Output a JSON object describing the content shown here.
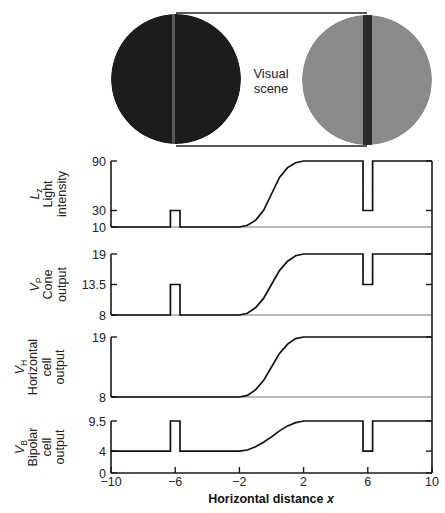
{
  "scene": {
    "label_line1": "Visual",
    "label_line2": "scene",
    "left_disk": {
      "cx": 176,
      "cy": 79,
      "r": 65,
      "fill": "#1c1c1c",
      "stripe_x": 172,
      "stripe_w": 3,
      "stripe_fill": "#5a5a5a"
    },
    "right_disk": {
      "cx": 367,
      "cy": 80,
      "r": 65,
      "fill": "#8a8a8a",
      "stripe_x": 363,
      "stripe_w": 9,
      "stripe_fill": "#2a2a2a"
    },
    "connector_top_y": 13,
    "connector_bottom_y": 146
  },
  "chart_data": {
    "type": "line",
    "title": "",
    "xlabel": "Horizontal distance x",
    "xlim": [
      -10,
      10
    ],
    "x_ticks": [
      -10,
      -6,
      -2,
      2,
      6,
      10
    ],
    "x_tick_labels": [
      "−10",
      "−6",
      "−2",
      "2",
      "6",
      "10"
    ],
    "grid": false,
    "panels": [
      {
        "id": "light",
        "symbol": "L",
        "subscript": "z",
        "label_lines": [
          "Light",
          "intensity"
        ],
        "y_ticks": [
          10,
          30,
          90
        ],
        "y_tick_labels": [
          "10",
          "30",
          "90"
        ],
        "ylim": [
          10,
          90
        ],
        "pixel": {
          "ymin_px": 227,
          "ymax_px": 161
        },
        "points": [
          [
            -10,
            10
          ],
          [
            -6.3,
            10
          ],
          [
            -6.3,
            30
          ],
          [
            -5.7,
            30
          ],
          [
            -5.7,
            10
          ],
          [
            -2,
            10
          ],
          [
            -1.5,
            12
          ],
          [
            -1,
            18
          ],
          [
            -0.5,
            30
          ],
          [
            0,
            50
          ],
          [
            0.5,
            70
          ],
          [
            1,
            82
          ],
          [
            1.5,
            88
          ],
          [
            2,
            90
          ],
          [
            5.7,
            90
          ],
          [
            5.7,
            30
          ],
          [
            6.3,
            30
          ],
          [
            6.3,
            90
          ],
          [
            10,
            90
          ]
        ]
      },
      {
        "id": "cone",
        "symbol": "V",
        "subscript": "P",
        "label_lines": [
          "Cone",
          "output"
        ],
        "y_ticks": [
          8,
          13.5,
          19
        ],
        "y_tick_labels": [
          "8",
          "13.5",
          "19"
        ],
        "ylim": [
          8,
          19
        ],
        "pixel": {
          "ymin_px": 315,
          "ymax_px": 254
        },
        "points": [
          [
            -10,
            8
          ],
          [
            -6.3,
            8
          ],
          [
            -6.3,
            13.5
          ],
          [
            -5.7,
            13.5
          ],
          [
            -5.7,
            8
          ],
          [
            -2,
            8
          ],
          [
            -1.5,
            8.3
          ],
          [
            -1,
            9.3
          ],
          [
            -0.5,
            11
          ],
          [
            0,
            13.5
          ],
          [
            0.5,
            16
          ],
          [
            1,
            17.7
          ],
          [
            1.5,
            18.7
          ],
          [
            2,
            19
          ],
          [
            5.7,
            19
          ],
          [
            5.7,
            13.5
          ],
          [
            6.3,
            13.5
          ],
          [
            6.3,
            19
          ],
          [
            10,
            19
          ]
        ]
      },
      {
        "id": "horizontal",
        "symbol": "V",
        "subscript": "H",
        "label_lines": [
          "Horizontal",
          "cell",
          "output"
        ],
        "y_ticks": [
          8,
          19
        ],
        "y_tick_labels": [
          "8",
          "19"
        ],
        "ylim": [
          8,
          19
        ],
        "pixel": {
          "ymin_px": 397,
          "ymax_px": 337
        },
        "points": [
          [
            -10,
            8
          ],
          [
            -2,
            8
          ],
          [
            -1.5,
            8.3
          ],
          [
            -1,
            9.3
          ],
          [
            -0.5,
            11
          ],
          [
            0,
            13.5
          ],
          [
            0.5,
            16
          ],
          [
            1,
            17.7
          ],
          [
            1.5,
            18.7
          ],
          [
            2,
            19
          ],
          [
            10,
            19
          ]
        ]
      },
      {
        "id": "bipolar",
        "symbol": "V",
        "subscript": "B",
        "label_lines": [
          "Bipolar",
          "cell",
          "output"
        ],
        "y_ticks": [
          0,
          4,
          9.5
        ],
        "y_tick_labels": [
          "0",
          "4",
          "9.5"
        ],
        "ylim": [
          0,
          9.5
        ],
        "pixel": {
          "ymin_px": 473,
          "ymax_px": 421
        },
        "points": [
          [
            -10,
            4
          ],
          [
            -6.3,
            4
          ],
          [
            -6.3,
            9.5
          ],
          [
            -5.7,
            9.5
          ],
          [
            -5.7,
            4
          ],
          [
            -2,
            4
          ],
          [
            -1.5,
            4.2
          ],
          [
            -1,
            4.8
          ],
          [
            -0.5,
            5.6
          ],
          [
            0,
            6.6
          ],
          [
            0.5,
            7.7
          ],
          [
            1,
            8.6
          ],
          [
            1.5,
            9.2
          ],
          [
            2,
            9.5
          ],
          [
            5.7,
            9.5
          ],
          [
            5.7,
            4
          ],
          [
            6.3,
            4
          ],
          [
            6.3,
            9.5
          ],
          [
            10,
            9.5
          ]
        ]
      }
    ]
  },
  "layout": {
    "x_left_px": 111,
    "x_right_px": 432,
    "xaxis_y_px": 473
  }
}
